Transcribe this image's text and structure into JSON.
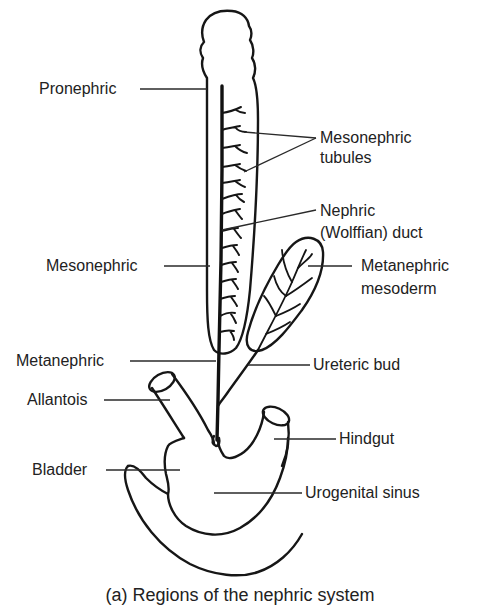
{
  "figure": {
    "caption": "(a) Regions of the nephric system",
    "colors": {
      "line": "#161616",
      "text": "#222222",
      "background": "#ffffff"
    }
  },
  "labels": {
    "pronephric": "Pronephric",
    "mesonephric_tubules_line1": "Mesonephric",
    "mesonephric_tubules_line2": "tubules",
    "nephric_duct_line1": "Nephric",
    "nephric_duct_line2": "(Wolffian) duct",
    "mesonephric": "Mesonephric",
    "metanephric_mesoderm_line1": "Metanephric",
    "metanephric_mesoderm_line2": "mesoderm",
    "metanephric": "Metanephric",
    "ureteric_bud": "Ureteric bud",
    "allantois": "Allantois",
    "hindgut": "Hindgut",
    "bladder": "Bladder",
    "urogenital_sinus": "Urogenital sinus"
  }
}
